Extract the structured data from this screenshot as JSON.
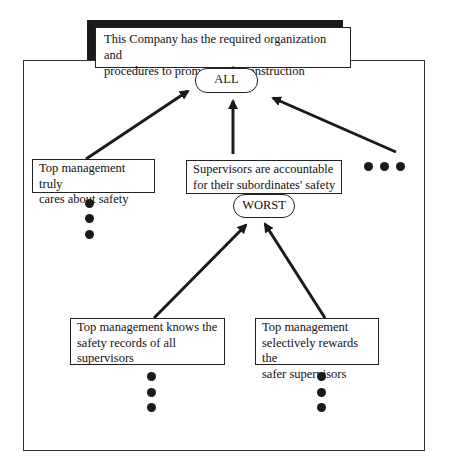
{
  "title": {
    "text_line1": "This Company has the required organization and",
    "text_line2": "procedures to promote safe construction"
  },
  "nodes": {
    "all": {
      "label": "ALL"
    },
    "worst": {
      "label": "WORST"
    },
    "top_mgmt_cares": {
      "line1": "Top management truly",
      "line2": "cares about safety"
    },
    "supervisors_accountable": {
      "line1": "Supervisors are accountable",
      "line2": "for their subordinates' safety"
    },
    "top_mgmt_knows": {
      "line1": "Top management knows the",
      "line2": "safety records of all",
      "line3": "supervisors"
    },
    "top_mgmt_rewards": {
      "line1": "Top management",
      "line2": "selectively rewards the",
      "line3": "safer supervisors"
    }
  },
  "edges": [
    {
      "from": "top_mgmt_cares",
      "to": "all"
    },
    {
      "from": "supervisors_accountable",
      "to": "all"
    },
    {
      "from": "more_factors_ellipsis",
      "to": "all"
    },
    {
      "from": "top_mgmt_knows",
      "to": "worst"
    },
    {
      "from": "top_mgmt_rewards",
      "to": "worst"
    }
  ],
  "ellipses": {
    "under_top_mgmt_cares": "vertical",
    "right_of_supervisors": "horizontal",
    "under_top_mgmt_knows": "vertical",
    "under_top_mgmt_rewards": "vertical"
  },
  "colors": {
    "line": "#222222",
    "shadow": "#1a1a1a",
    "background": "#ffffff"
  }
}
